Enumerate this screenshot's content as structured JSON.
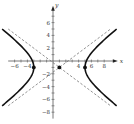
{
  "chart_data": {
    "type": "line",
    "title": "",
    "xlabel": "x",
    "ylabel": "y",
    "xlim": [
      -7,
      9.5
    ],
    "ylim": [
      -9,
      8
    ],
    "x_ticks": [
      -6,
      -4,
      4,
      6,
      8
    ],
    "x_ticks_minor": [
      -6,
      -5,
      -4,
      -3,
      -2,
      -1,
      1,
      2,
      3,
      4,
      5,
      6,
      7,
      8
    ],
    "y_ticks": [
      6,
      4,
      2,
      -2,
      -4,
      -6,
      -8
    ],
    "y_ticks_minor": [
      7,
      6,
      5,
      4,
      3,
      2,
      1,
      -1,
      -2,
      -3,
      -4,
      -5,
      -6,
      -7,
      -8
    ],
    "grid": false,
    "hyperbola": {
      "equation": "(x-1)^2/16 - (y+1)^2/9 = 1",
      "center": [
        1,
        -1
      ],
      "a": 4,
      "b": 3,
      "orientation": "horizontal",
      "y_range": [
        -7,
        5
      ]
    },
    "asymptotes": [
      {
        "name": "asymptote-positive",
        "slope": 0.75,
        "through": [
          1,
          -1
        ],
        "x_range": [
          -7,
          9
        ],
        "style": "dashed"
      },
      {
        "name": "asymptote-negative",
        "slope": -0.75,
        "through": [
          1,
          -1
        ],
        "x_range": [
          -7,
          9
        ],
        "style": "dashed"
      }
    ],
    "points": [
      {
        "name": "center",
        "x": 1,
        "y": -1
      },
      {
        "name": "vertex-left",
        "x": -3,
        "y": -1
      },
      {
        "name": "vertex-right",
        "x": 5,
        "y": -1
      }
    ],
    "colors": {
      "curve": "#111111",
      "axis": "#555555",
      "asymptote": "#777777",
      "point": "#111111"
    }
  }
}
